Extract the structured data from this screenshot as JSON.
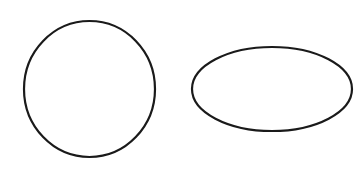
{
  "canvas": {
    "width": 362,
    "height": 180,
    "background": "#ffffff"
  },
  "stroke": {
    "color": "#1a1a1a",
    "width": 2.2
  },
  "shapes": [
    {
      "type": "circle",
      "label": "circle",
      "cx": 89.5,
      "cy": 89,
      "rx": 65.5,
      "ry": 68
    },
    {
      "type": "ellipse",
      "label": "ellipse",
      "cx": 272,
      "cy": 89,
      "rx": 80,
      "ry": 42
    }
  ]
}
